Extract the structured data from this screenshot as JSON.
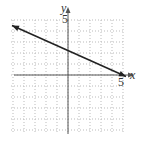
{
  "chart_data": {
    "type": "line",
    "title": "",
    "xlabel": "x",
    "ylabel": "y",
    "xlim": [
      -5,
      5
    ],
    "ylim": [
      -5,
      5
    ],
    "grid": true,
    "tick_labels": {
      "x": [
        "5"
      ],
      "y": [
        "5"
      ]
    },
    "series": [
      {
        "name": "line",
        "equation": "y = -x/2 + 5/2",
        "x": [
          -5,
          0,
          5
        ],
        "y": [
          5,
          2.5,
          0
        ],
        "arrows": "both"
      }
    ],
    "colors": {
      "grid": "#bbbbbb",
      "axis": "#555555",
      "line": "#222222"
    }
  },
  "labels": {
    "x_axis": "x",
    "y_axis": "y",
    "x_tick": "5",
    "y_tick": "5"
  }
}
